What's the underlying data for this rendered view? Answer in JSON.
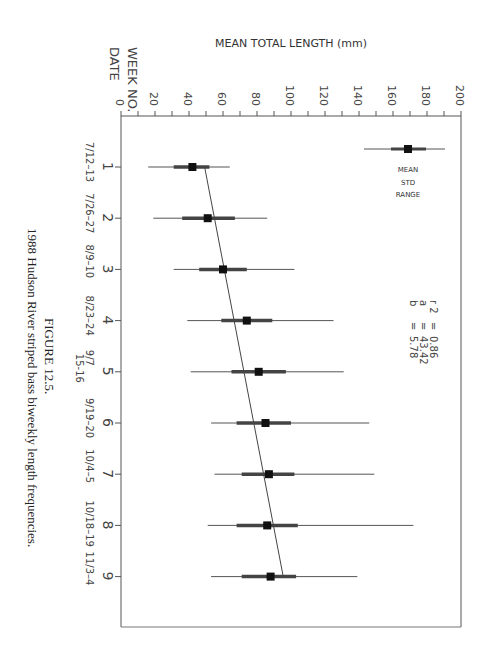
{
  "figure": {
    "caption_number": "FIGURE 12.5.",
    "caption_text": "1988 Hudson River striped bass biweekly length frequencies."
  },
  "chart_data": {
    "type": "scatter",
    "orientation": "rotated 90° clockwise (weeks run down the page, length runs left-to-right)",
    "title": "",
    "ylabel": "MEAN TOTAL LENGTH (mm)",
    "xlabel": "WEEK NO.",
    "xlabel_secondary": "DATE",
    "ylim": [
      0,
      200
    ],
    "y_ticks": [
      0,
      20,
      40,
      60,
      80,
      100,
      120,
      140,
      160,
      180,
      200
    ],
    "x_ticks": [
      1,
      2,
      3,
      4,
      5,
      6,
      7,
      8,
      9
    ],
    "dates": [
      "7/12-13",
      "7/26-27",
      "8/9-10",
      "8/23-24",
      "9/7 15-16",
      "9/19-20",
      "10/4-5",
      "10/18-19",
      "11/3-4"
    ],
    "grid": false,
    "series": [
      {
        "name": "MEAN",
        "values": [
          42,
          51,
          60,
          74,
          81,
          85,
          87,
          86,
          88
        ]
      },
      {
        "name": "STD low",
        "values": [
          31,
          36,
          46,
          59,
          65,
          68,
          71,
          68,
          71
        ]
      },
      {
        "name": "STD high",
        "values": [
          52,
          67,
          74,
          89,
          97,
          100,
          102,
          104,
          103
        ]
      },
      {
        "name": "RANGE min",
        "values": [
          16,
          19,
          31,
          39,
          41,
          53,
          55,
          51,
          53
        ]
      },
      {
        "name": "RANGE max",
        "values": [
          64,
          86,
          102,
          125,
          131,
          146,
          149,
          172,
          139
        ]
      }
    ],
    "regression": {
      "r2_label": "r 2",
      "r2": "0.86",
      "a_label": "a",
      "a": "43.42",
      "b_label": "b",
      "b": "5.78"
    },
    "legend": {
      "entries": [
        "MEAN",
        "STD",
        "RANGE"
      ],
      "position": "top-right"
    }
  }
}
